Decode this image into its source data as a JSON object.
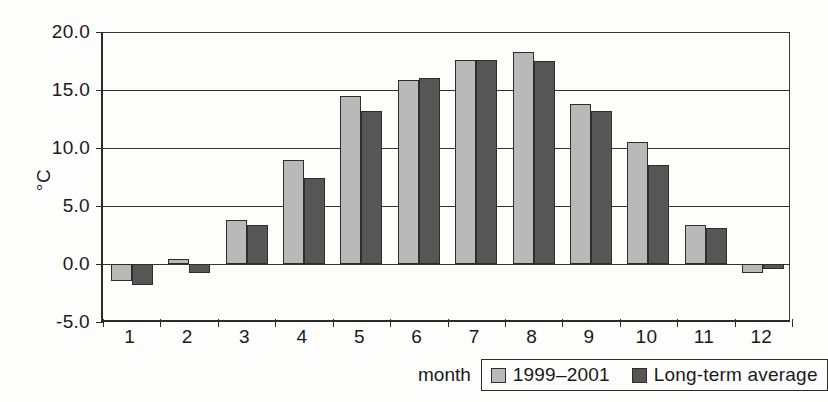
{
  "chart_data": {
    "type": "bar",
    "title": "",
    "subtitle": "",
    "xlabel": "month",
    "ylabel": "°C",
    "categories": [
      "1",
      "2",
      "3",
      "4",
      "5",
      "6",
      "7",
      "8",
      "9",
      "10",
      "11",
      "12"
    ],
    "series": [
      {
        "name": "1999–2001",
        "color": "#b9b9b9",
        "values": [
          -1.5,
          0.4,
          3.8,
          9.0,
          14.5,
          15.9,
          17.6,
          18.3,
          13.8,
          10.5,
          3.4,
          -0.8
        ]
      },
      {
        "name": "Long-term average",
        "color": "#565656",
        "values": [
          -1.8,
          -0.8,
          3.4,
          7.4,
          13.2,
          16.0,
          17.6,
          17.5,
          13.2,
          8.5,
          3.1,
          -0.4
        ]
      }
    ],
    "ylim": [
      -5.0,
      20.0
    ],
    "ytick_labels": [
      "20.0",
      "15.0",
      "10.0",
      "5.0",
      "0.0",
      "-5.0"
    ],
    "ytick_values": [
      20.0,
      15.0,
      10.0,
      5.0,
      0.0,
      -5.0
    ],
    "grid": true,
    "grid_axis": "y",
    "legend_position": "bottom-right",
    "legend_entries": [
      "1999–2001",
      "Long-term average"
    ]
  },
  "axes": {
    "y_title": "°C",
    "x_title": "month"
  }
}
